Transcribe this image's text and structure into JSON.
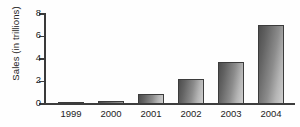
{
  "chart_data": {
    "type": "bar",
    "title": "",
    "xlabel": "",
    "ylabel": "Sales (in trillions)",
    "categories": [
      "1999",
      "2000",
      "2001",
      "2002",
      "2003",
      "2004"
    ],
    "values": [
      0.1,
      0.25,
      0.85,
      2.2,
      3.7,
      7.0
    ],
    "ylim": [
      0,
      8
    ],
    "yticks": [
      0,
      2,
      4,
      6,
      8
    ],
    "ytick_labels": [
      "0",
      "2",
      "4",
      "6",
      "8"
    ],
    "grid": false,
    "legend": null,
    "series": [
      {
        "name": "Sales",
        "values": [
          0.1,
          0.25,
          0.85,
          2.2,
          3.7,
          7.0
        ]
      }
    ],
    "colors": {
      "bar_dark": "#4d4d4d",
      "bar_light": "#cfcfcf",
      "bar_edge": "#3c3c3c",
      "axis": "#3a3a3a",
      "text": "#232323",
      "background": "#fefefe"
    }
  }
}
